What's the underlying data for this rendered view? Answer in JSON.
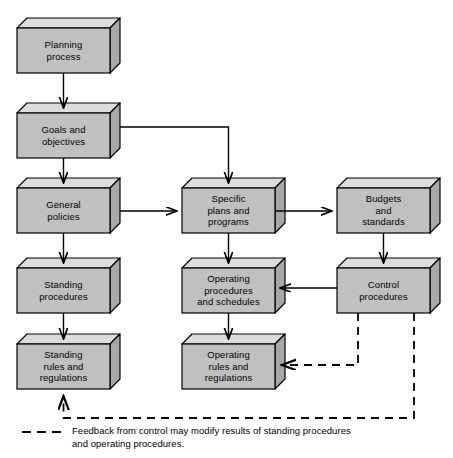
{
  "figure": {
    "width": 453,
    "height": 458,
    "background": "#ffffff"
  },
  "style": {
    "box_front_fill": "#c0c0c0",
    "box_top_fill": "#dcdcdc",
    "box_side_fill": "#a8a8a8",
    "box_stroke": "#000000",
    "connector_color": "#000000",
    "dashed_color": "#000000"
  },
  "nodes": [
    {
      "id": "planning-process",
      "label": "Planning\nprocess",
      "x": 17,
      "y": 28,
      "w": 93,
      "h": 45,
      "depth": 10
    },
    {
      "id": "goals-objectives",
      "label": "Goals and\nobjectives",
      "x": 17,
      "y": 113,
      "w": 93,
      "h": 45,
      "depth": 10
    },
    {
      "id": "general-policies",
      "label": "General\npolicies",
      "x": 17,
      "y": 188,
      "w": 93,
      "h": 45,
      "depth": 10
    },
    {
      "id": "specific-plans",
      "label": "Specific\nplans and\nprograms",
      "x": 182,
      "y": 188,
      "w": 93,
      "h": 45,
      "depth": 10
    },
    {
      "id": "budgets-standards",
      "label": "Budgets\nand\nstandards",
      "x": 337,
      "y": 188,
      "w": 93,
      "h": 45,
      "depth": 10
    },
    {
      "id": "standing-procedures",
      "label": "Standing\nprocedures",
      "x": 17,
      "y": 268,
      "w": 93,
      "h": 45,
      "depth": 10
    },
    {
      "id": "operating-procedures",
      "label": "Operating\nprocedures\nand schedules",
      "x": 182,
      "y": 268,
      "w": 93,
      "h": 45,
      "depth": 10
    },
    {
      "id": "control-procedures",
      "label": "Control\nprocedures",
      "x": 337,
      "y": 268,
      "w": 93,
      "h": 45,
      "depth": 10
    },
    {
      "id": "standing-rules",
      "label": "Standing\nrules and\nregulations",
      "x": 17,
      "y": 344,
      "w": 93,
      "h": 45,
      "depth": 10
    },
    {
      "id": "operating-rules",
      "label": "Operating\nrules and\nregulations",
      "x": 182,
      "y": 344,
      "w": 93,
      "h": 45,
      "depth": 10
    }
  ],
  "connectors": [
    {
      "id": "planning-to-goals",
      "from": "planning-process",
      "to": "goals-objectives",
      "style": "solid",
      "arrow": true
    },
    {
      "id": "goals-to-general",
      "from": "goals-objectives",
      "to": "general-policies",
      "style": "solid",
      "arrow": true
    },
    {
      "id": "goals-to-specific",
      "from": "goals-objectives",
      "to": "specific-plans",
      "style": "solid",
      "arrow": true
    },
    {
      "id": "general-to-specific",
      "from": "general-policies",
      "to": "specific-plans",
      "style": "solid",
      "arrow": true
    },
    {
      "id": "specific-to-budgets",
      "from": "specific-plans",
      "to": "budgets-standards",
      "style": "solid",
      "arrow": true
    },
    {
      "id": "general-to-standing-proc",
      "from": "general-policies",
      "to": "standing-procedures",
      "style": "solid",
      "arrow": true
    },
    {
      "id": "specific-to-operating-proc",
      "from": "specific-plans",
      "to": "operating-procedures",
      "style": "solid",
      "arrow": true
    },
    {
      "id": "budgets-to-control",
      "from": "budgets-standards",
      "to": "control-procedures",
      "style": "solid",
      "arrow": true
    },
    {
      "id": "control-to-operating-proc",
      "from": "control-procedures",
      "to": "operating-procedures",
      "style": "solid",
      "arrow": true
    },
    {
      "id": "standing-proc-to-rules",
      "from": "standing-procedures",
      "to": "standing-rules",
      "style": "solid",
      "arrow": true
    },
    {
      "id": "operating-proc-to-rules",
      "from": "operating-procedures",
      "to": "operating-rules",
      "style": "solid",
      "arrow": true
    },
    {
      "id": "control-to-operating-rules",
      "from": "control-procedures",
      "to": "operating-rules",
      "style": "dashed",
      "arrow": true
    },
    {
      "id": "control-to-standing-rules",
      "from": "control-procedures",
      "to": "standing-rules",
      "style": "dashed",
      "arrow": true
    }
  ],
  "legend": {
    "sample_style": "dashed",
    "text": "Feedback from control may modify results of standing procedures\nand operating procedures."
  }
}
